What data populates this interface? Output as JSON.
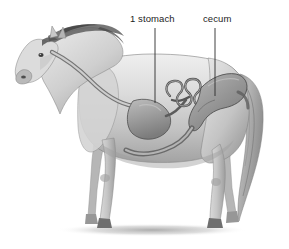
{
  "figure": {
    "kind": "anatomical-illustration",
    "view": "left-side-profile",
    "background_color": "#ffffff",
    "width": 289,
    "height": 249
  },
  "labels": [
    {
      "id": "stomach",
      "text": "1 stomach",
      "x": 130,
      "y": 13,
      "leader": {
        "x": 155,
        "y1": 28,
        "y2": 103
      }
    },
    {
      "id": "cecum",
      "text": "cecum",
      "x": 203,
      "y": 13,
      "leader": {
        "x": 215,
        "y1": 28,
        "y2": 96
      }
    }
  ],
  "leader_line": {
    "color": "#2a2a2a",
    "width": 0.9
  },
  "palette": {
    "coat_light": "#e8e8e8",
    "coat_mid": "#c9c9c9",
    "coat_shadow": "#9a9a9a",
    "coat_dark": "#6d6d6d",
    "mane_dark": "#4a4a4a",
    "outline": "#5a5a5a",
    "organ_light": "#d5d5d5",
    "organ_mid": "#a8a8a8",
    "organ_dark": "#7b7b7b",
    "organ_outline": "#4f4f4f",
    "ground_shadow": "#b8b8b8",
    "text": "#1c1c1c"
  },
  "anatomy_parts": [
    {
      "id": "esophagus",
      "name": "esophagus",
      "label_shown": false
    },
    {
      "id": "stomach",
      "name": "stomach",
      "label_shown": true
    },
    {
      "id": "small-intestine",
      "name": "small intestine",
      "label_shown": false
    },
    {
      "id": "cecum",
      "name": "cecum",
      "label_shown": true
    },
    {
      "id": "large-colon",
      "name": "large colon",
      "label_shown": false
    }
  ]
}
